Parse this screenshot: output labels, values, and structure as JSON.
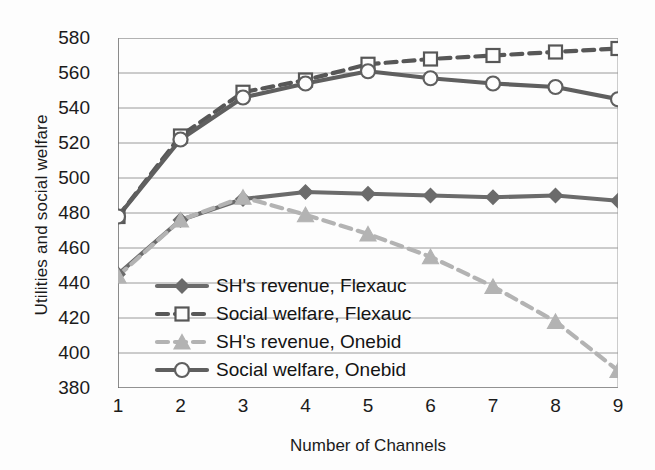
{
  "chart_data": {
    "type": "line",
    "title": "",
    "xlabel": "Number of Channels",
    "ylabel": "Utilities and social welfare",
    "x": [
      1,
      2,
      3,
      4,
      5,
      6,
      7,
      8,
      9
    ],
    "xtick_labels": [
      "1",
      "2",
      "3",
      "4",
      "5",
      "6",
      "7",
      "8",
      "9"
    ],
    "ytick_labels": [
      "580",
      "560",
      "540",
      "520",
      "500",
      "480",
      "460",
      "440",
      "420",
      "400",
      "380"
    ],
    "xlim": [
      1,
      9
    ],
    "ylim": [
      380,
      580
    ],
    "ystep": 20,
    "grid": "horizontal",
    "legend_position": "inside-lower-left",
    "series": [
      {
        "name": "SH's revenue, Flexauc",
        "marker": "diamond",
        "line_style": "solid",
        "color": "#6b6b6b",
        "values": [
          445,
          476,
          488,
          492,
          491,
          490,
          489,
          490,
          487
        ]
      },
      {
        "name": "Social welfare, Flexauc",
        "marker": "square-open",
        "line_style": "dashed",
        "color": "#575757",
        "values": [
          478,
          524,
          549,
          556,
          565,
          568,
          570,
          572,
          574
        ]
      },
      {
        "name": "SH's revenue, Onebid",
        "marker": "triangle",
        "line_style": "dashed",
        "color": "#b3b3b3",
        "values": [
          444,
          476,
          489,
          479,
          468,
          455,
          438,
          418,
          390
        ]
      },
      {
        "name": "Social welfare, Onebid",
        "marker": "circle-open",
        "line_style": "solid",
        "color": "#5f5f5f",
        "values": [
          478,
          522,
          546,
          554,
          561,
          557,
          554,
          552,
          545
        ]
      }
    ]
  },
  "legend": {
    "items": [
      {
        "label": "SH's revenue, Flexauc"
      },
      {
        "label": "Social welfare, Flexauc"
      },
      {
        "label": "SH's revenue, Onebid"
      },
      {
        "label": "Social welfare, Onebid"
      }
    ]
  }
}
